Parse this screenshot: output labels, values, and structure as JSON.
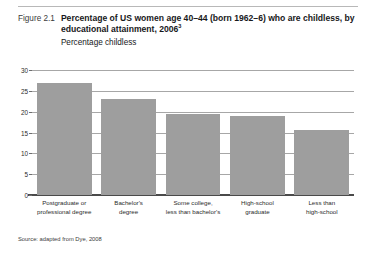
{
  "figure": {
    "number_label": "Figure 2.1",
    "title": "Percentage of US women age 40–44 (born 1962–6) who are childless, by educational attainment, 2006",
    "title_superscript": "3",
    "subtitle": "Percentage childless",
    "source_note": "Source: adapted from Dye, 2008"
  },
  "chart_data": {
    "type": "bar",
    "title": "Percentage of US women age 40–44 (born 1962–6) who are childless, by educational attainment, 2006",
    "subtitle": "Percentage childless",
    "xlabel": "",
    "ylabel": "Percentage childless",
    "categories": [
      "Postgraduate or professional degree",
      "Bachelor's degree",
      "Some college, less than bachelor's",
      "High-school graduate",
      "Less than high-school"
    ],
    "category_lines": [
      [
        "Postgraduate or",
        "professional degree"
      ],
      [
        "Bachelor's",
        "degree"
      ],
      [
        "Some college,",
        "less than bachelor's"
      ],
      [
        "High-school",
        "graduate"
      ],
      [
        "Less than",
        "high-school"
      ]
    ],
    "values": [
      27,
      23,
      19.5,
      19,
      15.5
    ],
    "ylim": [
      0,
      30
    ],
    "yticks": [
      0,
      5,
      10,
      15,
      20,
      25,
      30
    ],
    "ytick_labels": [
      "0",
      "5",
      "10",
      "15",
      "20",
      "25",
      "30"
    ],
    "grid": true,
    "legend": false,
    "bar_color": "#9e9e9e",
    "gridline_color": "#a7a7a7",
    "axis_color": "#4a4a4a"
  }
}
